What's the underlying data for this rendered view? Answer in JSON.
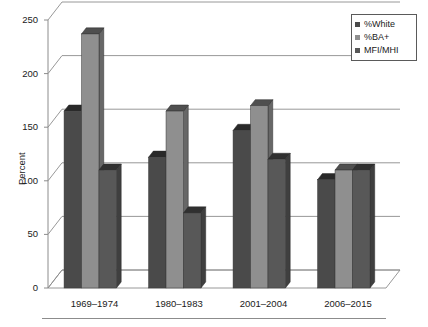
{
  "chart_data": {
    "type": "bar",
    "title": "",
    "subtitle": "",
    "xlabel": "",
    "ylabel": "Percent",
    "categories": [
      "1969–1974",
      "1980–1983",
      "2001–2004",
      "2006–2015"
    ],
    "series": [
      {
        "name": "%White",
        "values": [
          165,
          122,
          147,
          101
        ],
        "color": "#4a4a4a"
      },
      {
        "name": "%BA+",
        "values": [
          237,
          165,
          170,
          110
        ],
        "color": "#8f8f8f"
      },
      {
        "name": "MFI/MHI",
        "values": [
          110,
          70,
          120,
          110
        ],
        "color": "#585858"
      }
    ],
    "ylim": [
      0,
      250
    ],
    "yticks": [
      0,
      50,
      100,
      150,
      200,
      250
    ],
    "ytick_labels": [
      "0",
      "50",
      "100",
      "150",
      "200",
      "250"
    ],
    "grid": true,
    "grid_axis": "y",
    "legend_position": "top-right",
    "style": "3d-bar",
    "background": "#ffffff",
    "axis_color": "#8c8c8c",
    "grid_color": "#8c8c8c"
  },
  "legend": {
    "items": [
      {
        "label": "%White",
        "swatch": "#4a4a4a"
      },
      {
        "label": "%BA+",
        "swatch": "#8f8f8f"
      },
      {
        "label": "MFI/MHI",
        "swatch": "#585858"
      }
    ]
  }
}
